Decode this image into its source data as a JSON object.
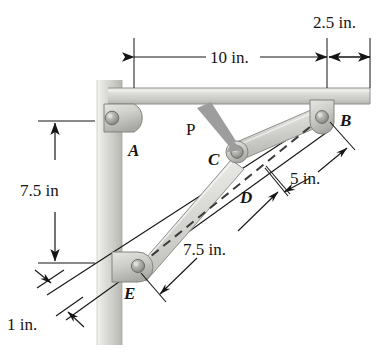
{
  "figure": {
    "background_color": "#ffffff",
    "line_color": "#151515",
    "metal_light": "#e8e8e6",
    "metal_mid": "#c9c9c6",
    "metal_dark": "#9a9a97",
    "wall_light": "#efefec",
    "wall_dark": "#b9b9b5",
    "arrow_gray": "#9d9d9d"
  },
  "point_labels": {
    "a": "A",
    "b": "B",
    "c": "C",
    "d": "D",
    "e": "E"
  },
  "force_label": "P",
  "dimensions": {
    "top_span": "10 in.",
    "top_overhang": "2.5 in.",
    "vertical": "7.5 in",
    "wall_offset": "1 in.",
    "link_lower": "7.5 in.",
    "link_upper": "5 in."
  },
  "geometry": {
    "pin_a": [
      112,
      118
    ],
    "pin_b": [
      322,
      117
    ],
    "pin_c": [
      237,
      152
    ],
    "pin_e": [
      138,
      266
    ],
    "point_d": [
      262,
      176
    ],
    "beam_left": 108,
    "beam_right": 370,
    "beam_top": 88,
    "beam_bottom": 104,
    "wall_left": 97,
    "wall_right": 122,
    "wall_top": 80,
    "wall_bottom": 345
  }
}
